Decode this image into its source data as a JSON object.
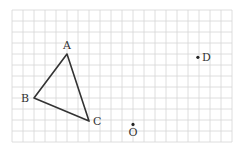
{
  "diagram": {
    "grid": {
      "origin_px": [
        12,
        10
      ],
      "cell_px": 11,
      "cols": 20,
      "rows": 12,
      "line_color": "#d6d6d6"
    },
    "triangle": {
      "stroke_color": "#333333",
      "vertices": [
        "A",
        "B",
        "C"
      ]
    },
    "points": [
      {
        "id": "A",
        "label": "A",
        "grid": [
          5,
          4
        ],
        "label_pos": "above",
        "dot": false
      },
      {
        "id": "B",
        "label": "B",
        "grid": [
          2,
          8
        ],
        "label_pos": "left",
        "dot": false
      },
      {
        "id": "C",
        "label": "C",
        "grid": [
          7,
          10.1
        ],
        "label_pos": "right",
        "dot": false
      },
      {
        "id": "O",
        "label": "O",
        "grid": [
          11,
          10.4
        ],
        "label_pos": "below",
        "dot": true
      },
      {
        "id": "D",
        "label": "D",
        "grid": [
          16.9,
          4.3
        ],
        "label_pos": "right",
        "dot": true
      }
    ]
  }
}
